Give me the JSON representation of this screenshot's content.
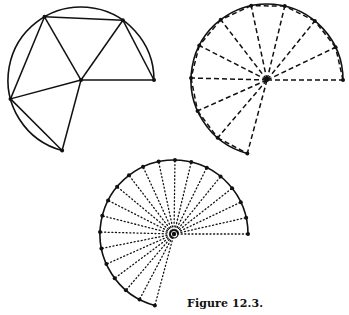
{
  "caption": "Figure 12.3.",
  "colors": {
    "ink": "#111111",
    "background": "#ffffff"
  },
  "figures": [
    {
      "id": "polygon-approximation",
      "description": "Arc of circle approximated by inscribed triangles (coarse)",
      "center": [
        81,
        80
      ],
      "radius": 73,
      "arc_start_deg": 0,
      "arc_end_deg": 255,
      "vertex_angles_deg": [
        0,
        55,
        120,
        195,
        255
      ],
      "radial_style": "solid",
      "chord_style": "solid",
      "arc_style": "solid"
    },
    {
      "id": "dashed-subdivision",
      "description": "Arc subdivided into 10 sectors with dashed radii and chords",
      "center": [
        267,
        80
      ],
      "radius": 76,
      "arc_start_deg": 0,
      "arc_end_deg": 255,
      "segments": 10,
      "radial_style": "dashed",
      "chord_style": "dashed",
      "arc_style": "solid"
    },
    {
      "id": "dotted-subdivision",
      "description": "Arc subdivided into 20 sectors with dotted radii, approaching the limit",
      "center": [
        174,
        234
      ],
      "radius": 74,
      "arc_start_deg": 0,
      "arc_end_deg": 255,
      "segments": 20,
      "radial_style": "dotted",
      "chord_style": "none",
      "arc_style": "solid"
    }
  ]
}
